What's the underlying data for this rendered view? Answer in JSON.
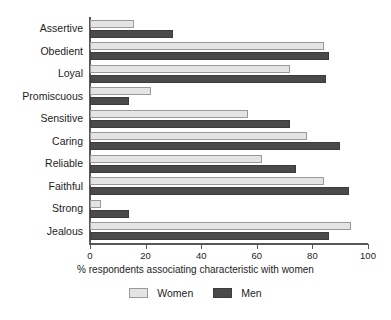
{
  "chart_data": {
    "type": "bar",
    "orientation": "horizontal",
    "title": "",
    "subtitle": "",
    "xlabel": "% respondents associating characteristic with women",
    "ylabel": "",
    "xlim": [
      0,
      100
    ],
    "xticks": [
      0,
      20,
      40,
      60,
      80,
      100
    ],
    "xtick_labels": [
      "0",
      "20",
      "40",
      "60",
      "80",
      "100"
    ],
    "grid": false,
    "legend_position": "bottom-center",
    "categories": [
      "Assertive",
      "Obedient",
      "Loyal",
      "Promiscuous",
      "Sensitive",
      "Caring",
      "Reliable",
      "Faithful",
      "Strong",
      "Jealous"
    ],
    "series": [
      {
        "name": "Women",
        "color": "#e4e4e4",
        "edge_color": "#9a9a9a",
        "values": [
          16,
          84,
          72,
          22,
          57,
          78,
          62,
          84,
          4,
          94
        ]
      },
      {
        "name": "Men",
        "color": "#4a4a4a",
        "edge_color": "#3c3c3c",
        "values": [
          30,
          86,
          85,
          14,
          72,
          90,
          74,
          93,
          14,
          86
        ]
      }
    ]
  },
  "legend": {
    "items": [
      {
        "label": "Women",
        "swatch": "light-swatch-icon"
      },
      {
        "label": "Men",
        "swatch": "dark-swatch-icon"
      }
    ]
  },
  "colors": {
    "women": "#e4e4e4",
    "men": "#4a4a4a",
    "axis": "#58585a",
    "text": "#1d1d1d",
    "background": "#ffffff"
  }
}
